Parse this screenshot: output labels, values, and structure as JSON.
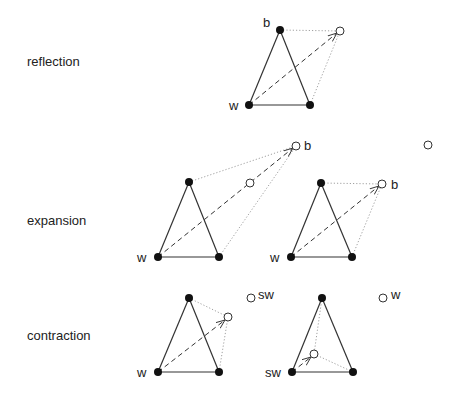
{
  "rows": [
    {
      "label": "reflection"
    },
    {
      "label": "expansion"
    },
    {
      "label": "contraction"
    }
  ],
  "points": {
    "b": "b",
    "w": "w",
    "sw": "sw"
  },
  "colors": {
    "line": "#333333",
    "dot_fill": "#111111",
    "background": "#ffffff"
  }
}
